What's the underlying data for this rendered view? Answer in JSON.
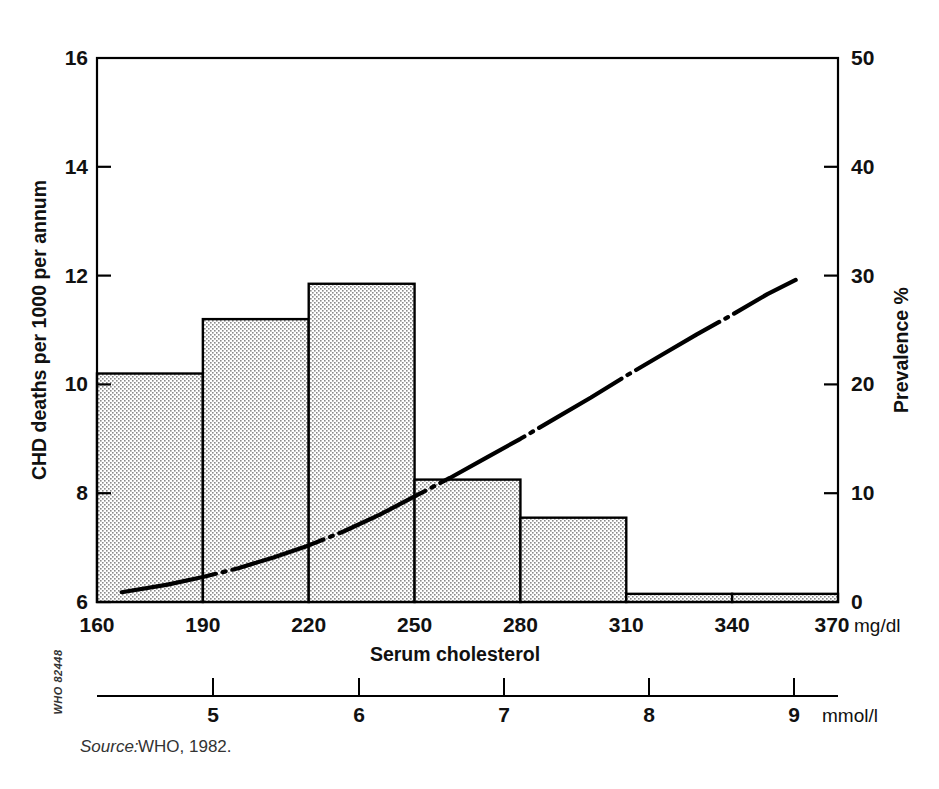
{
  "figure": {
    "source_prefix": "Source:",
    "source_text": "WHO, 1982.",
    "who_code": "WHO 82448"
  },
  "chart_data": {
    "type": "bar",
    "title": "",
    "xlabel": "Serum cholesterol",
    "xunit": "mg/dl",
    "ylabel": "CHD deaths per 1000 per annum",
    "y2label": "Prevalence %",
    "x2unit": "mmol/l",
    "xlim": [
      160,
      370
    ],
    "ylim": [
      6,
      16
    ],
    "y2lim": [
      0,
      50
    ],
    "x2lim": [
      4.14,
      9.57
    ],
    "grid": false,
    "legend": "none",
    "xticks": [
      160,
      190,
      220,
      250,
      280,
      310,
      340,
      370
    ],
    "xticklabels": [
      "160",
      "190",
      "220",
      "250",
      "280",
      "310",
      "340",
      "370"
    ],
    "yticks": [
      6,
      8,
      10,
      12,
      14,
      16
    ],
    "yticklabels": [
      "6",
      "8",
      "10",
      "12",
      "14",
      "16"
    ],
    "y2ticks": [
      0,
      10,
      20,
      30,
      40,
      50
    ],
    "y2ticklabels": [
      "0",
      "10",
      "20",
      "30",
      "40",
      "50"
    ],
    "x2ticks": [
      5,
      6,
      7,
      8,
      9
    ],
    "x2ticklabels": [
      "5",
      "6",
      "7",
      "8",
      "9"
    ],
    "categories": [
      "160-190",
      "190-220",
      "220-250",
      "250-280",
      "280-310",
      "310-340",
      "340-370"
    ],
    "bin_edges": [
      160,
      190,
      220,
      250,
      280,
      310,
      340,
      370
    ],
    "values": [
      10.2,
      11.2,
      11.85,
      8.25,
      7.55,
      6.15,
      6.15
    ],
    "bar_fill": "#e8e8e8",
    "bar_edge": "#000000",
    "series": [
      {
        "name": "CHD deaths per 1000 per annum",
        "axis": "left",
        "style": "bar",
        "values": [
          10.2,
          11.2,
          11.85,
          8.25,
          7.55,
          6.15,
          6.15
        ]
      },
      {
        "name": "Prevalence %",
        "axis": "right",
        "style": "dash-dot-line",
        "x": [
          167,
          180,
          190,
          200,
          210,
          220,
          230,
          240,
          250,
          260,
          270,
          280,
          290,
          300,
          310,
          320,
          330,
          340,
          350,
          358
        ],
        "values": [
          0.9,
          1.6,
          2.3,
          3.1,
          4.1,
          5.2,
          6.5,
          8.0,
          9.7,
          11.4,
          13.2,
          15.0,
          16.9,
          18.8,
          20.8,
          22.7,
          24.6,
          26.4,
          28.3,
          29.6
        ]
      }
    ]
  }
}
